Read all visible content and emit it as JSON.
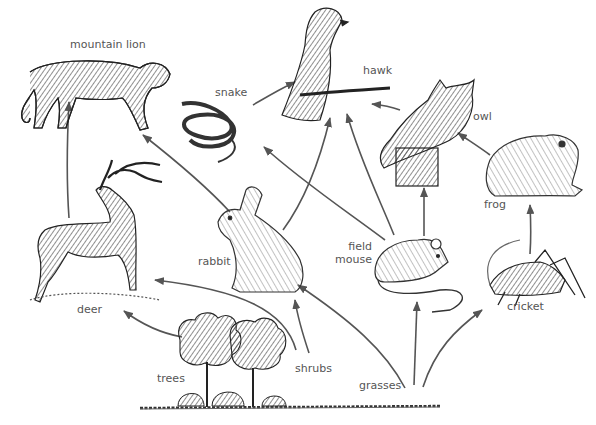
{
  "diagram": {
    "type": "food-web",
    "colors": {
      "arrow": "#555555",
      "ink": "#2a2a2a",
      "label": "#555555",
      "background": "#ffffff"
    },
    "organisms": [
      {
        "id": "mountain_lion",
        "label": "mountain lion",
        "icon": "mountain-lion-icon"
      },
      {
        "id": "hawk",
        "label": "hawk",
        "icon": "hawk-icon"
      },
      {
        "id": "snake",
        "label": "snake",
        "icon": "snake-icon"
      },
      {
        "id": "owl",
        "label": "owl",
        "icon": "owl-icon"
      },
      {
        "id": "frog",
        "label": "frog",
        "icon": "frog-icon"
      },
      {
        "id": "deer",
        "label": "deer",
        "icon": "deer-icon"
      },
      {
        "id": "rabbit",
        "label": "rabbit",
        "icon": "rabbit-icon"
      },
      {
        "id": "field_mouse",
        "label_line1": "field",
        "label_line2": "mouse",
        "icon": "mouse-icon"
      },
      {
        "id": "cricket",
        "label": "cricket",
        "icon": "cricket-icon"
      },
      {
        "id": "trees",
        "label": "trees",
        "icon": "trees-icon"
      },
      {
        "id": "shrubs",
        "label": "shrubs",
        "icon": "shrubs-icon"
      },
      {
        "id": "grasses",
        "label": "grasses",
        "icon": "grasses-icon"
      }
    ],
    "edges": [
      {
        "from": "deer",
        "to": "mountain lion"
      },
      {
        "from": "rabbit",
        "to": "mountain lion"
      },
      {
        "from": "snake",
        "to": "hawk"
      },
      {
        "from": "rabbit",
        "to": "hawk"
      },
      {
        "from": "field mouse",
        "to": "hawk"
      },
      {
        "from": "owl",
        "to": "hawk"
      },
      {
        "from": "field mouse",
        "to": "snake"
      },
      {
        "from": "field mouse",
        "to": "owl"
      },
      {
        "from": "frog",
        "to": "owl"
      },
      {
        "from": "cricket",
        "to": "frog"
      },
      {
        "from": "trees",
        "to": "deer"
      },
      {
        "from": "shrubs",
        "to": "deer"
      },
      {
        "from": "shrubs",
        "to": "rabbit"
      },
      {
        "from": "grasses",
        "to": "rabbit"
      },
      {
        "from": "grasses",
        "to": "field mouse"
      },
      {
        "from": "grasses",
        "to": "cricket"
      }
    ]
  }
}
